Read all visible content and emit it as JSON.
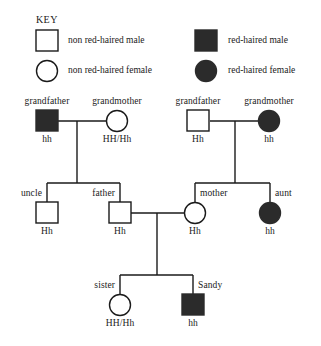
{
  "key": {
    "title": "KEY",
    "entries": [
      {
        "icon": "open-square-icon",
        "label": "non red-haired male",
        "shape": "square",
        "filled": false
      },
      {
        "icon": "open-circle-icon",
        "label": "non red-haired female",
        "shape": "circle",
        "filled": false
      },
      {
        "icon": "filled-square-icon",
        "label": "red-haired male",
        "shape": "square",
        "filled": true
      },
      {
        "icon": "filled-circle-icon",
        "label": "red-haired female",
        "shape": "circle",
        "filled": true
      }
    ]
  },
  "colors": {
    "affected": "#2b2b2b",
    "line": "#1a1a1a",
    "background": "#ffffff",
    "text": "#1a1a1a"
  },
  "pedigree": {
    "generations": [
      {
        "name": "generation-1",
        "members": [
          {
            "id": "paternal-grandfather",
            "name": "grandfather",
            "genotype": "hh",
            "sex": "male",
            "affected": true
          },
          {
            "id": "paternal-grandmother",
            "name": "grandmother",
            "genotype": "HH/Hh",
            "sex": "female",
            "affected": false
          },
          {
            "id": "maternal-grandfather",
            "name": "grandfather",
            "genotype": "Hh",
            "sex": "male",
            "affected": false
          },
          {
            "id": "maternal-grandmother",
            "name": "grandmother",
            "genotype": "hh",
            "sex": "female",
            "affected": true
          }
        ]
      },
      {
        "name": "generation-2",
        "members": [
          {
            "id": "uncle",
            "name": "uncle",
            "genotype": "Hh",
            "sex": "male",
            "affected": false
          },
          {
            "id": "father",
            "name": "father",
            "genotype": "Hh",
            "sex": "male",
            "affected": false
          },
          {
            "id": "mother",
            "name": "mother",
            "genotype": "Hh",
            "sex": "female",
            "affected": false
          },
          {
            "id": "aunt",
            "name": "aunt",
            "genotype": "hh",
            "sex": "female",
            "affected": true
          }
        ]
      },
      {
        "name": "generation-3",
        "members": [
          {
            "id": "sister",
            "name": "sister",
            "genotype": "HH/Hh",
            "sex": "female",
            "affected": false
          },
          {
            "id": "sandy",
            "name": "Sandy",
            "genotype": "hh",
            "sex": "male",
            "affected": true
          }
        ]
      }
    ]
  }
}
